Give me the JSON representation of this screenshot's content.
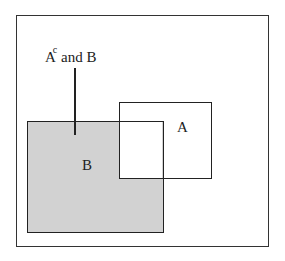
{
  "diagram": {
    "type": "venn-rectangles",
    "universe": {
      "label": ""
    },
    "sets": [
      {
        "id": "A",
        "label": "A",
        "shaded": false
      },
      {
        "id": "B",
        "label": "B",
        "shaded": true
      }
    ],
    "annotation": {
      "base": "A",
      "superscript": "c",
      "rest": " and B",
      "points_to": "B minus A region"
    },
    "colors": {
      "shade": "#d2d2d2",
      "outline": "#222222",
      "background": "#ffffff"
    }
  }
}
